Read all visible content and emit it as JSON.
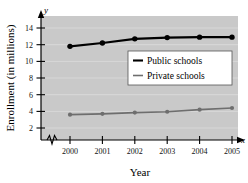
{
  "chart_data": {
    "type": "line",
    "title": "",
    "xlabel": "Year",
    "ylabel": "Enrollment (in millions)",
    "x_axis_variable": "x",
    "y_axis_variable": "y",
    "categories": [
      "2000",
      "2001",
      "2002",
      "2003",
      "2004",
      "2005"
    ],
    "x": [
      2000,
      2001,
      2002,
      2003,
      2004,
      2005
    ],
    "xlim": [
      2000,
      2005
    ],
    "ylim": [
      0,
      15
    ],
    "y_ticks": [
      2,
      4,
      6,
      8,
      10,
      12,
      14
    ],
    "y_tick_labels": [
      "2",
      "4",
      "6",
      "8",
      "10",
      "12",
      "14"
    ],
    "grid": true,
    "grid_orientation": "horizontal",
    "axis_break": true,
    "legend_position": "center",
    "plot_background": "#c9c9c9",
    "series": [
      {
        "name": "Public schools",
        "color": "#000000",
        "marker": "circle",
        "values": [
          11.8,
          12.2,
          12.7,
          12.85,
          12.9,
          12.9
        ]
      },
      {
        "name": "Private schools",
        "color": "#6e6e6e",
        "marker": "circle",
        "values": [
          3.6,
          3.7,
          3.85,
          3.95,
          4.2,
          4.4
        ]
      }
    ]
  },
  "legend": {
    "entries": [
      {
        "label": "Public schools",
        "color": "#000000"
      },
      {
        "label": "Private schools",
        "color": "#6e6e6e"
      }
    ]
  },
  "labels": {
    "y_axis_title": "Enrollment (in millions)",
    "x_axis_title": "Year",
    "y_variable": "y",
    "x_variable": "x"
  }
}
